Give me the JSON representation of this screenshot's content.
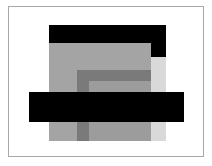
{
  "composition": {
    "description": "Abstract arrangement of nested gray rectangles with two black bars inside a thin frame",
    "colors": {
      "background": "#ffffff",
      "frame": "#a8a8a8",
      "black": "#000000",
      "mid_gray": "#a4a4a4",
      "dark_gray": "#7a7a7a",
      "inner_gray": "#9c9c9c",
      "light_gray": "#d9d9d9"
    }
  }
}
